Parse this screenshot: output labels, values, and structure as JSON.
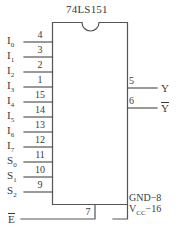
{
  "diagram": {
    "kind": "logic-symbol",
    "device": "74LS151",
    "title": "74LS151",
    "body": {
      "x": 52,
      "y": 22,
      "width": 76,
      "height": 183,
      "notch": "top-center-semicircle"
    },
    "stroke_color": "#555555",
    "text_color": "#3a3a3a",
    "background": "#ffffff"
  },
  "inputs": [
    {
      "name": "I",
      "sub": "0",
      "pin": "4",
      "y": 42
    },
    {
      "name": "I",
      "sub": "1",
      "pin": "3",
      "y": 57
    },
    {
      "name": "I",
      "sub": "2",
      "pin": "2",
      "y": 72
    },
    {
      "name": "I",
      "sub": "3",
      "pin": "1",
      "y": 87
    },
    {
      "name": "I",
      "sub": "4",
      "pin": "15",
      "y": 102
    },
    {
      "name": "I",
      "sub": "5",
      "pin": "14",
      "y": 117
    },
    {
      "name": "I",
      "sub": "6",
      "pin": "13",
      "y": 132
    },
    {
      "name": "I",
      "sub": "7",
      "pin": "12",
      "y": 147
    },
    {
      "name": "S",
      "sub": "0",
      "pin": "11",
      "y": 162
    },
    {
      "name": "S",
      "sub": "1",
      "pin": "10",
      "y": 177
    },
    {
      "name": "S",
      "sub": "2",
      "pin": "9",
      "y": 192
    }
  ],
  "outputs": [
    {
      "name": "Y",
      "overbar": false,
      "pin": "5",
      "y": 88
    },
    {
      "name": "Y",
      "overbar": true,
      "pin": "6",
      "y": 108
    }
  ],
  "enable": {
    "name": "E",
    "overbar": true,
    "pin": "7",
    "label": "E"
  },
  "power": {
    "gnd_label": "GND",
    "gnd_pin": "8",
    "gnd_text": "GND−8",
    "vcc_label": "V",
    "vcc_sub": "CC",
    "vcc_pin": "16",
    "vcc_text": "Vₑₑ−16",
    "dash": "−"
  }
}
